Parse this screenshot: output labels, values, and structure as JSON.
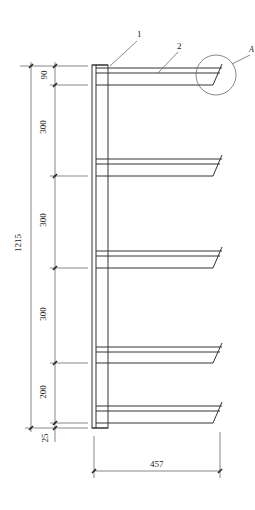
{
  "drawing": {
    "type": "cantilever rack elevation",
    "callouts": [
      {
        "id": "callout-1",
        "label": "1",
        "refers_to": "column"
      },
      {
        "id": "callout-2",
        "label": "2",
        "refers_to": "arm"
      },
      {
        "id": "callout-detail",
        "label": "A",
        "refers_to": "arm tip detail circle"
      }
    ],
    "dimensions": {
      "overall_height": "1215",
      "segments": [
        "90",
        "300",
        "300",
        "300",
        "200",
        "25"
      ],
      "arm_length": "457"
    },
    "arm_count": 5
  }
}
